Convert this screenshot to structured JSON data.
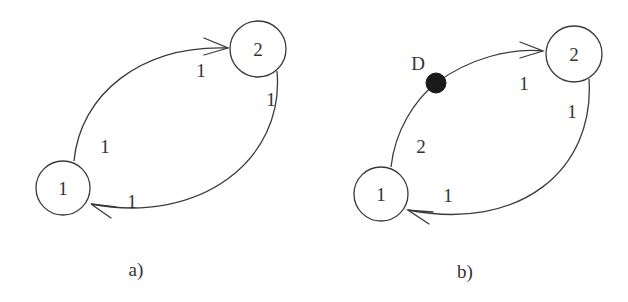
{
  "diagram": {
    "panels": [
      {
        "caption": "a)",
        "nodes": [
          {
            "id": "1",
            "label": "1"
          },
          {
            "id": "2",
            "label": "2"
          }
        ],
        "edges": [
          {
            "from": "1",
            "to": "2",
            "path": "upper",
            "weight_start": "1",
            "weight_end": "1"
          },
          {
            "from": "2",
            "to": "1",
            "path": "lower",
            "weight_start": "1",
            "weight_end": "1"
          }
        ]
      },
      {
        "caption": "b)",
        "nodes": [
          {
            "id": "1",
            "label": "1"
          },
          {
            "id": "2",
            "label": "2"
          }
        ],
        "delay_element": {
          "label": "D"
        },
        "edges": [
          {
            "from": "1",
            "to": "2",
            "path": "upper",
            "via": "D",
            "weight_start": "2",
            "weight_end": "1"
          },
          {
            "from": "2",
            "to": "1",
            "path": "lower",
            "weight_start": "1",
            "weight_end": "1"
          }
        ]
      }
    ]
  }
}
